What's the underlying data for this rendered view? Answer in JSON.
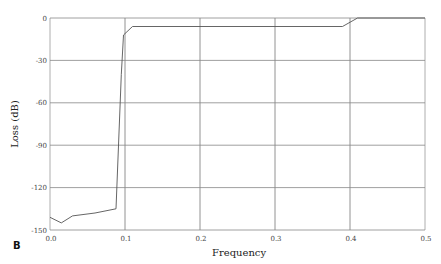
{
  "chart_data": {
    "type": "line",
    "title": "",
    "panel_label": "B",
    "xlabel": "Frequency",
    "ylabel": "Loss (dB)",
    "xlim": [
      0.0,
      0.5
    ],
    "ylim": [
      -150,
      0
    ],
    "xticks": [
      "0.0",
      "0.1",
      "0.2",
      "0.3",
      "0.4",
      "0.5"
    ],
    "yticks": [
      "0",
      "-30",
      "-60",
      "-90",
      "-120",
      "-150"
    ],
    "grid": true,
    "legend": null,
    "series": [
      {
        "name": "loss",
        "x": [
          0.0,
          0.015,
          0.03,
          0.06,
          0.088,
          0.095,
          0.098,
          0.11,
          0.39,
          0.41,
          0.5
        ],
        "y": [
          -141,
          -145,
          -140,
          -138,
          -135,
          -40,
          -12,
          -6,
          -6,
          0,
          0
        ]
      }
    ]
  }
}
